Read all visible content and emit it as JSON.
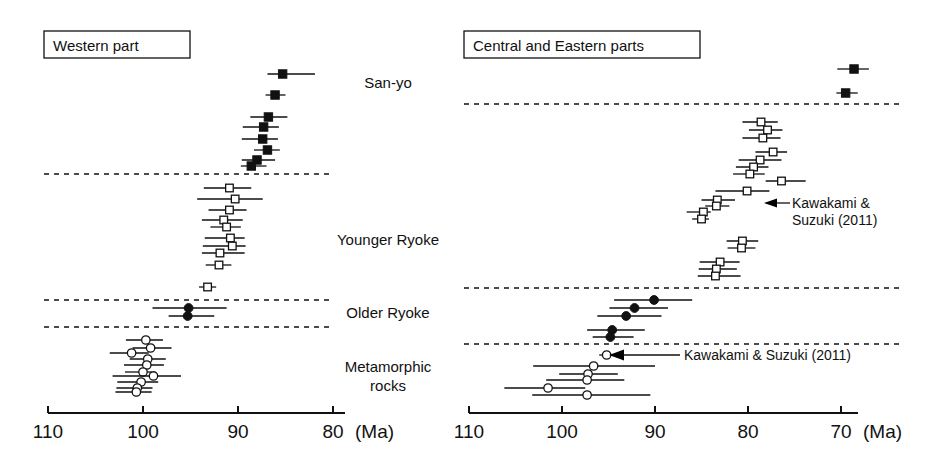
{
  "figure": {
    "panels": [
      {
        "id": "western",
        "title": "Western part",
        "axis": {
          "ticks": [
            110,
            100,
            90,
            80
          ],
          "tick_labels": [
            "110",
            "100",
            "90",
            "80"
          ],
          "unit": "(Ma)",
          "xmin": 110,
          "xmax": 78.5
        }
      },
      {
        "id": "central-eastern",
        "title": "Central and Eastern parts",
        "axis": {
          "ticks": [
            110,
            100,
            90,
            80,
            70
          ],
          "tick_labels": [
            "110",
            "100",
            "90",
            "80",
            "70"
          ],
          "unit": "(Ma)",
          "xmin": 110,
          "xmax": 68.5
        }
      }
    ],
    "categories": [
      {
        "key": "san-yo",
        "label": "San-yo"
      },
      {
        "key": "younger-ryoke",
        "label": "Younger Ryoke"
      },
      {
        "key": "older-ryoke",
        "label": "Older Ryoke"
      },
      {
        "key": "metamorphic-rocks",
        "label": "Metamorphic\nrocks"
      }
    ],
    "annotations": [
      {
        "key": "anno-right-upper",
        "text_lines": [
          "Kawakami &",
          "Suzuki (2011)"
        ],
        "panel": "central-eastern"
      },
      {
        "key": "anno-right-lower",
        "text_lines": [
          "Kawakami & Suzuki (2011)"
        ],
        "panel": "central-eastern"
      }
    ]
  },
  "chart_data": {
    "type": "scatter",
    "xlabel": "(Ma)",
    "ylabel": "",
    "grid": false,
    "legend": "none",
    "x_axis_inverted": true,
    "marker_key": {
      "filled-square": "San-yo granitoid (age with error bar)",
      "open-square": "Younger Ryoke granitoid (age with error bar)",
      "filled-circle": "Older Ryoke granitoid (age with error bar)",
      "open-circle": "Metamorphic rocks (age with error bar)"
    },
    "panels": [
      {
        "name": "Western part",
        "xlim": [
          110,
          78.5
        ],
        "xticks": [
          110,
          100,
          90,
          80
        ],
        "groups": [
          {
            "category": "San-yo",
            "marker": "filled-square",
            "points": [
              {
                "age": 85.3,
                "low": 86.9,
                "high": 81.9
              },
              {
                "age": 86.1,
                "low": 87.1,
                "high": 85.0
              },
              {
                "age": 86.8,
                "low": 88.7,
                "high": 84.8
              },
              {
                "age": 87.3,
                "low": 89.5,
                "high": 85.7
              },
              {
                "age": 87.4,
                "low": 89.6,
                "high": 85.8
              },
              {
                "age": 86.9,
                "low": 88.3,
                "high": 85.6
              },
              {
                "age": 88.0,
                "low": 89.6,
                "high": 86.1
              },
              {
                "age": 88.6,
                "low": 89.7,
                "high": 87.0
              }
            ]
          },
          {
            "category": "Younger Ryoke",
            "marker": "open-square",
            "points": [
              {
                "age": 90.9,
                "low": 93.6,
                "high": 88.6
              },
              {
                "age": 90.3,
                "low": 94.3,
                "high": 87.4
              },
              {
                "age": 90.9,
                "low": 93.1,
                "high": 89.1
              },
              {
                "age": 91.5,
                "low": 93.8,
                "high": 89.5
              },
              {
                "age": 91.2,
                "low": 92.9,
                "high": 89.7
              },
              {
                "age": 90.8,
                "low": 93.5,
                "high": 89.3
              },
              {
                "age": 90.6,
                "low": 93.7,
                "high": 89.2
              },
              {
                "age": 91.9,
                "low": 93.8,
                "high": 89.3
              },
              {
                "age": 92.0,
                "low": 93.4,
                "high": 90.7
              },
              {
                "age": 93.2,
                "low": 94.1,
                "high": 92.3
              }
            ]
          },
          {
            "category": "Older Ryoke",
            "marker": "filled-circle",
            "points": [
              {
                "age": 95.2,
                "low": 99.0,
                "high": 91.2
              },
              {
                "age": 95.3,
                "low": 97.3,
                "high": 92.5
              }
            ]
          },
          {
            "category": "Metamorphic rocks",
            "marker": "open-circle",
            "points": [
              {
                "age": 99.7,
                "low": 101.8,
                "high": 97.9
              },
              {
                "age": 99.2,
                "low": 101.1,
                "high": 97.0
              },
              {
                "age": 101.2,
                "low": 103.5,
                "high": 99.4
              },
              {
                "age": 99.5,
                "low": 101.4,
                "high": 97.6
              },
              {
                "age": 99.6,
                "low": 102.0,
                "high": 97.8
              },
              {
                "age": 100.0,
                "low": 101.9,
                "high": 98.7
              },
              {
                "age": 98.9,
                "low": 103.2,
                "high": 96.0
              },
              {
                "age": 100.2,
                "low": 102.7,
                "high": 98.4
              },
              {
                "age": 100.6,
                "low": 102.8,
                "high": 99.0
              },
              {
                "age": 100.7,
                "low": 102.9,
                "high": 99.1
              }
            ]
          }
        ]
      },
      {
        "name": "Central and Eastern parts",
        "xlim": [
          110,
          68.5
        ],
        "xticks": [
          110,
          100,
          90,
          80,
          70
        ],
        "groups": [
          {
            "category": "San-yo",
            "marker": "filled-square",
            "points": [
              {
                "age": 68.6,
                "low": 70.4,
                "high": 67.0
              },
              {
                "age": 69.5,
                "low": 70.5,
                "high": 68.2
              }
            ]
          },
          {
            "category": "Younger Ryoke",
            "marker": "open-square",
            "points": [
              {
                "age": 78.6,
                "low": 80.6,
                "high": 76.8
              },
              {
                "age": 77.9,
                "low": 79.9,
                "high": 76.3
              },
              {
                "age": 78.4,
                "low": 80.6,
                "high": 76.5
              },
              {
                "age": 77.3,
                "low": 79.2,
                "high": 75.8
              },
              {
                "age": 78.7,
                "low": 81.0,
                "high": 76.4
              },
              {
                "age": 79.4,
                "low": 81.3,
                "high": 77.8
              },
              {
                "age": 79.8,
                "low": 81.6,
                "high": 78.2
              },
              {
                "age": 76.4,
                "low": 78.1,
                "high": 73.8
              },
              {
                "age": 80.1,
                "low": 83.5,
                "high": 77.7
              },
              {
                "age": 83.3,
                "low": 85.0,
                "high": 81.4
              },
              {
                "age": 83.4,
                "low": 84.6,
                "high": 82.0
              },
              {
                "age": 84.8,
                "low": 86.6,
                "high": 84.0
              },
              {
                "age": 85.0,
                "low": 86.0,
                "high": 84.2
              },
              {
                "age": 80.6,
                "low": 82.3,
                "high": 78.9
              },
              {
                "age": 80.7,
                "low": 82.2,
                "high": 79.2
              },
              {
                "age": 83.0,
                "low": 85.2,
                "high": 80.9
              },
              {
                "age": 83.4,
                "low": 85.3,
                "high": 81.2
              },
              {
                "age": 83.5,
                "low": 85.4,
                "high": 80.8
              }
            ]
          },
          {
            "category": "Older Ryoke",
            "marker": "filled-circle",
            "points": [
              {
                "age": 90.1,
                "low": 94.4,
                "high": 86.0
              },
              {
                "age": 92.2,
                "low": 94.9,
                "high": 88.6
              },
              {
                "age": 93.1,
                "low": 96.2,
                "high": 89.3
              },
              {
                "age": 94.6,
                "low": 97.3,
                "high": 91.1
              },
              {
                "age": 94.8,
                "low": 96.7,
                "high": 92.3
              }
            ]
          },
          {
            "category": "Metamorphic rocks",
            "marker": "open-circle",
            "points": [
              {
                "age": 95.2,
                "low": 96.0,
                "high": 94.3
              },
              {
                "age": 96.6,
                "low": 103.1,
                "high": 90.0
              },
              {
                "age": 97.2,
                "low": 100.3,
                "high": 94.0
              },
              {
                "age": 97.3,
                "low": 101.7,
                "high": 93.3
              },
              {
                "age": 101.5,
                "low": 106.2,
                "high": 97.5
              },
              {
                "age": 97.3,
                "low": 103.2,
                "high": 90.5
              }
            ]
          }
        ]
      }
    ]
  }
}
